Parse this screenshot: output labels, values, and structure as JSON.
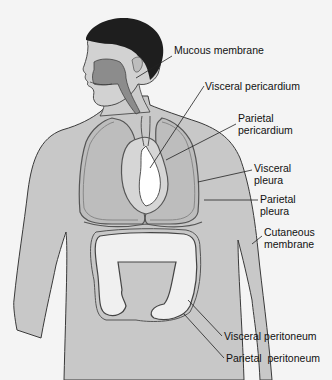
{
  "diagram": {
    "colors": {
      "background": "#f4f4f4",
      "skin": "#c8c8c8",
      "hair": "#1e1e1e",
      "outline": "#3a3a3a",
      "membrane": "#7a7a7a",
      "organ_light": "#f0f0f0",
      "text": "#111111"
    },
    "labels": [
      {
        "id": "mucous-membrane",
        "lines": [
          "Mucous membrane"
        ],
        "x": 174,
        "y": 50
      },
      {
        "id": "visceral-pericardium",
        "lines": [
          "Visceral pericardium"
        ],
        "x": 205,
        "y": 80
      },
      {
        "id": "parietal-pericardium",
        "lines": [
          "Parietal",
          "pericardium"
        ],
        "x": 238,
        "y": 117
      },
      {
        "id": "visceral-pleura",
        "lines": [
          "Visceral",
          "pleura"
        ],
        "x": 254,
        "y": 165
      },
      {
        "id": "parietal-pleura",
        "lines": [
          "Parietal",
          "pleura"
        ],
        "x": 260,
        "y": 196
      },
      {
        "id": "cutaneous-membrane",
        "lines": [
          "Cutaneous",
          "membrane"
        ],
        "x": 264,
        "y": 229
      },
      {
        "id": "visceral-peritoneum",
        "lines": [
          "Visceral peritoneum"
        ],
        "x": 224,
        "y": 331
      },
      {
        "id": "parietal-peritoneum",
        "lines": [
          "Parietal  peritoneum"
        ],
        "x": 226,
        "y": 353
      }
    ]
  }
}
